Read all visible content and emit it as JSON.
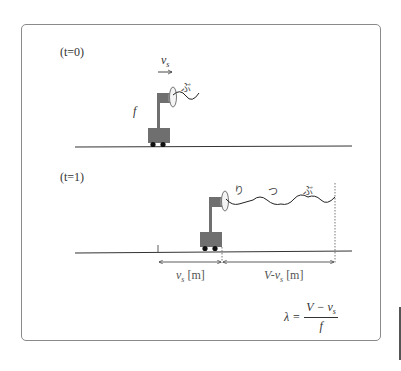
{
  "diagram": {
    "panel_t0": {
      "label": "(t=0)",
      "velocity_label": "v",
      "velocity_sub": "s",
      "frequency_label": "f",
      "sound_text": "ぶ"
    },
    "panel_t1": {
      "label": "(t=1)",
      "sound_text": [
        "り",
        "つ",
        "ぶ"
      ],
      "dim_left": {
        "var": "v",
        "sub": "s",
        "unit": "[m]"
      },
      "dim_right": {
        "prefix": "V-v",
        "sub": "s",
        "unit": "[m]"
      }
    },
    "formula": {
      "lhs": "λ =",
      "numerator_main": "V − v",
      "numerator_sub": "s",
      "denominator": "f"
    },
    "colors": {
      "cart": "#6f6f6f",
      "wheel": "#111111",
      "line": "#333333",
      "border": "#8a8a8a"
    }
  }
}
